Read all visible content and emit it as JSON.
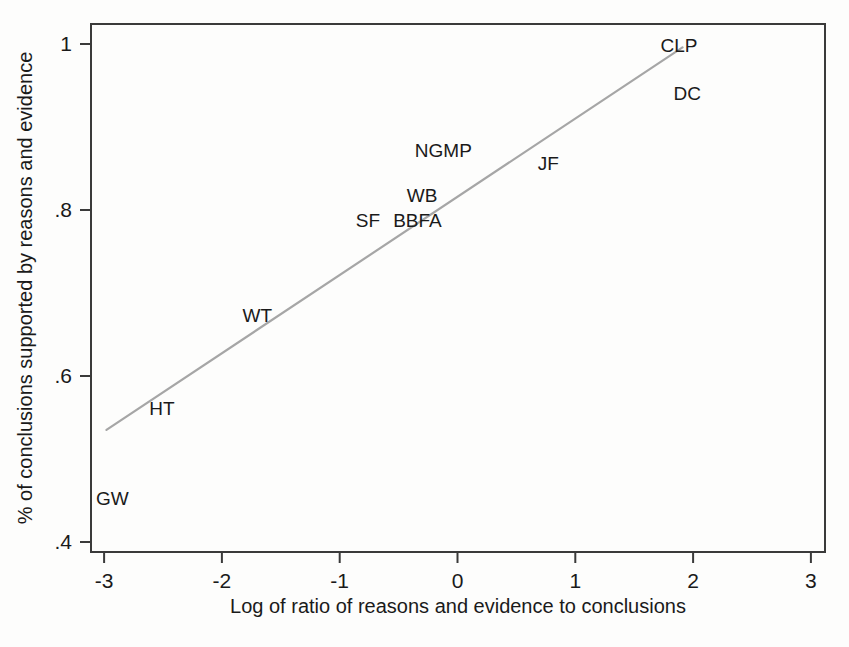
{
  "chart_data": {
    "type": "scatter",
    "title": "",
    "subtitle": "",
    "xlabel": "Log of ratio of reasons and evidence to conclusions",
    "ylabel": "% of conclusions supported by reasons and evidence",
    "xlim": [
      -3,
      3
    ],
    "ylim": [
      0.4,
      1.02
    ],
    "xticks": [
      -3,
      -2,
      -1,
      0,
      1,
      2,
      3
    ],
    "xticklabels": [
      "-3",
      "-2",
      "-1",
      "0",
      "1",
      "2",
      "3"
    ],
    "yticks": [
      0.4,
      0.6,
      0.8,
      1.0
    ],
    "yticklabels": [
      ".4",
      ".6",
      ".8",
      "1"
    ],
    "grid": false,
    "legend": "none",
    "point_style": "text-label",
    "points": [
      {
        "label": "GW",
        "x": -2.93,
        "y": 0.452
      },
      {
        "label": "HT",
        "x": -2.51,
        "y": 0.56
      },
      {
        "label": "WT",
        "x": -1.7,
        "y": 0.672
      },
      {
        "label": "SF",
        "x": -0.76,
        "y": 0.787
      },
      {
        "label": "BBFA",
        "x": -0.34,
        "y": 0.787
      },
      {
        "label": "WB",
        "x": -0.3,
        "y": 0.817
      },
      {
        "label": "NGMP",
        "x": -0.12,
        "y": 0.871
      },
      {
        "label": "JF",
        "x": 0.77,
        "y": 0.855
      },
      {
        "label": "CLP",
        "x": 1.88,
        "y": 0.997
      },
      {
        "label": "DC",
        "x": 1.95,
        "y": 0.94
      }
    ],
    "fit_line": {
      "name": "linear fit",
      "x": [
        -2.98,
        1.91
      ],
      "y": [
        0.535,
        0.996
      ],
      "color": "#a6a6a6"
    },
    "colors": {
      "axis": "#3a3a3a",
      "text": "#1a1a1a",
      "fit": "#a6a6a6",
      "background": "#fdfdfc"
    }
  }
}
